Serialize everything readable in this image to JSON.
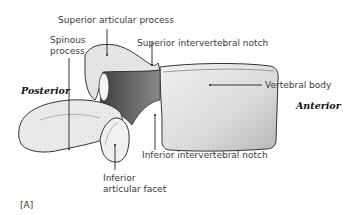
{
  "figure": {
    "tag": "[A]"
  },
  "orientation": {
    "posterior": "Posterior",
    "anterior": "Anterior"
  },
  "labels": {
    "superior_articular_process": "Superior articular process",
    "spinous_process_line1": "Spinous",
    "spinous_process_line2": "process",
    "superior_intervertebral_notch": "Superior intervertebral notch",
    "vertebral_body": "Vertebral body",
    "inferior_intervertebral_notch": "Inferior intervertebral notch",
    "inferior_articular_facet_line1": "Inferior",
    "inferior_articular_facet_line2": "articular facet"
  },
  "colors": {
    "bone_fill": "#e9e9e9",
    "bone_shade": "#9a9a9a",
    "pedicle_dark": "#555555",
    "outline": "#333333",
    "leader_line": "#222222"
  }
}
